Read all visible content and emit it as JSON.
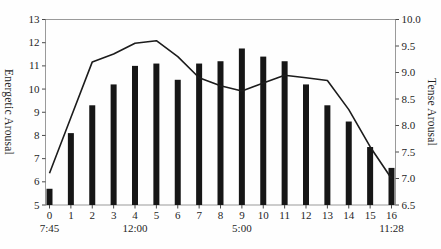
{
  "chart_data": {
    "type": "bar",
    "title": "",
    "x": [
      0,
      1,
      2,
      3,
      4,
      5,
      6,
      7,
      8,
      9,
      10,
      11,
      12,
      13,
      14,
      15,
      16
    ],
    "x_tick_labels": [
      "0",
      "1",
      "2",
      "3",
      "4",
      "5",
      "6",
      "7",
      "8",
      "9",
      "10",
      "11",
      "12",
      "13",
      "14",
      "15",
      "16"
    ],
    "x_time_labels": [
      {
        "text": "7:45",
        "at": 0
      },
      {
        "text": "12:00",
        "at": 4
      },
      {
        "text": "5:00",
        "at": 9
      },
      {
        "text": "11:28",
        "at": 16
      }
    ],
    "series": [
      {
        "name": "Energetic Arousal",
        "type": "bar",
        "axis": "left",
        "values": [
          5.7,
          8.1,
          9.3,
          10.2,
          11.0,
          11.1,
          10.4,
          11.1,
          11.2,
          11.75,
          11.4,
          11.2,
          10.2,
          9.3,
          8.6,
          7.5,
          6.6
        ]
      },
      {
        "name": "Tense Arousal",
        "type": "line",
        "axis": "right",
        "values": [
          7.1,
          8.15,
          9.2,
          9.35,
          9.55,
          9.6,
          9.3,
          8.9,
          8.75,
          8.65,
          8.8,
          8.95,
          8.9,
          8.85,
          8.3,
          7.6,
          7.0
        ]
      }
    ],
    "left_axis": {
      "label": "Energetic Arousal",
      "min": 5,
      "max": 13,
      "ticks": [
        5,
        6,
        7,
        8,
        9,
        10,
        11,
        12,
        13
      ]
    },
    "right_axis": {
      "label": "Tense Arousal",
      "min": 6.5,
      "max": 10.0,
      "ticks": [
        6.5,
        7.0,
        7.5,
        8.0,
        8.5,
        9.0,
        9.5,
        10.0
      ]
    },
    "grid": false,
    "legend": "none",
    "colors": {
      "bar": "#161616",
      "line": "#1c1c1c",
      "frame": "#9a9a9a",
      "tick": "#4a4a4a",
      "text": "#1f1f1f"
    }
  }
}
